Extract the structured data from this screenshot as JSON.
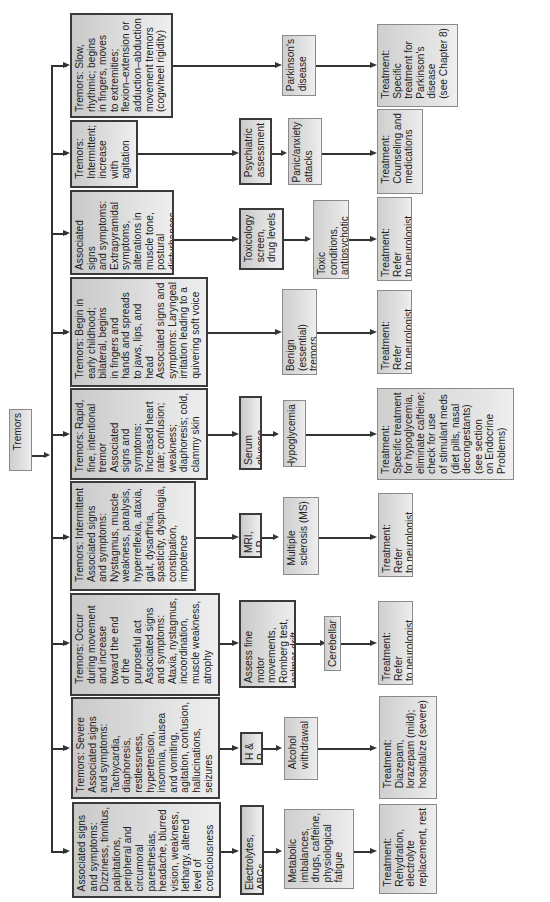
{
  "root": {
    "label": "Tremors"
  },
  "branches": [
    {
      "symptoms": "Tremors: Slow,\nrhythmic; begins\nin fingers, moves\nto extremities;\nflexion–extension or\nadduction–abduction\nmovement tremors\n(cogwheel rigidity)",
      "test": "",
      "diagnosis": "Parkinson's\ndisease",
      "treatment": "Treatment:\nSpecific\ntreatment for\nParkinson's\ndisease\n(see Chapter 8)"
    },
    {
      "symptoms": "Tremors:\nIntermittent;\nincrease\nwith\nagitation",
      "test": "Psychiatric\nassessment",
      "diagnosis": "Panic/anxiety\nattacks",
      "treatment": "Treatment:\nCounseling and\nmedications"
    },
    {
      "symptoms": "Associated signs\nand symptoms:\nExtrapyramidal\nsymptoms,\nalterations in\nmuscle tone,\npostural\ndisturbances",
      "test": "Toxicology\nscreen,\ndrug levels",
      "diagnosis": "Toxic conditions,\nantipsychotic\ndrugs, caffeine",
      "treatment": "Treatment: Refer\nto neurologist"
    },
    {
      "symptoms": "Tremors: Begin in\nearly childhood;\nbilateral, begins\nin fingers and\nhands and spreads\nto jaws, lips, and\nhead\nAssociated signs and\nsymptoms: Laryngeal\nirritation leading to a\nquivering soft voice",
      "test": "",
      "diagnosis": "Benign (essential)\ntremors",
      "treatment": "Treatment: Refer\nto neurologist"
    },
    {
      "symptoms": "Tremors: Rapid,\nfine, intentional\ntremor\nAssociated\nsigns and\nsymptoms:\nIncreased heart\nrate; confusion;\nweakness;\ndiaphoresis; cold,\nclammy skin",
      "test": "Serum glucose",
      "diagnosis": "Hypoglycemia",
      "treatment": "Treatment:\nSpecific treatment\nfor hypoglycemia,\neliminate caffeine;\ncheck for use\nof stimulant meds\n(diet pills, nasal\ndecongestants)\n(see section\non Endocrine\nProblems)"
    },
    {
      "symptoms": "Tremors: Intermittent\nAssociated signs\nand symptoms:\nNystagmus, muscle\nweakness, paralysis,\nhyperreflexia, ataxia,\ngait, dysarthria,\nspasticity, dysphagia,\nconstipation,\nimpotence",
      "test": "MRI, LP",
      "diagnosis": "Multiple\nsclerosis (MS)",
      "treatment": "Treatment: Refer\nto neurologist"
    },
    {
      "symptoms": "Tremors: Occur\nduring movement\nand increase\ntoward the end\nof the\npurposeful act\nAssociated signs\nand symptoms:\nAtaxia, nystagmus,\nincoordination,\nmuscle weakness,\natrophy",
      "test": "Assess fine motor\nmovements,\nRomberg test,\npalmar drift",
      "diagnosis": "Cerebellar",
      "treatment": "Treatment: Refer\nto neurologist"
    },
    {
      "symptoms": "Tremors: Severe\nAssociated signs\nand symptoms:\nTachycardia,\ndiaphoresis,\nrestlessness,\nhypertension,\ninsomnia, nausea\nand vomiting,\nagitation, confusion,\nhallucinations,\nseizures",
      "test": "H & P",
      "diagnosis": "Alcohol\nwithdrawal",
      "treatment": "Treatment:\nDiazepam,\nlorazepam (mild);\nhospitalize (severe)"
    },
    {
      "symptoms": "Associated signs\nand symptoms:\nDizziness, tinnitus,\npalpitations,\nperipheral and\ncircumoral\nparesthesias,\nheadache, blurred\nvision, weakness,\nlethargy, altered\nlevel of\nconsciousness",
      "test": "Electrolytes, ABGs",
      "diagnosis": "Metabolic\nimbalances,\ndrugs, caffeine,\nphysiological\nfatigue",
      "treatment": "Treatment:\nRehydration,\nelectrolyte\nreplacement, rest"
    }
  ]
}
